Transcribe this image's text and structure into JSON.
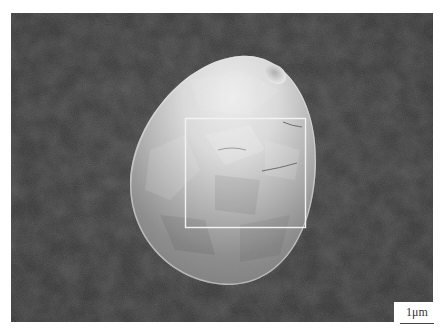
{
  "figure": {
    "type": "SEM micrograph",
    "background_color": "#3a3a3a",
    "particle_color_light": "#e6e6e6",
    "particle_color_dark": "#7a7a7a",
    "highlight_box": {
      "color": "#f2f2f2",
      "x": 185,
      "y": 118,
      "width": 120,
      "height": 109
    },
    "scale_bar": {
      "label": "1μm",
      "color": "#444444"
    },
    "caption_mark": "a) b)"
  }
}
